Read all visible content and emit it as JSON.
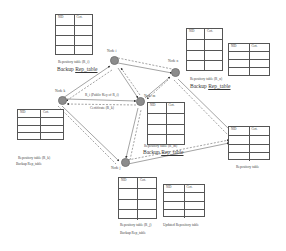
{
  "diagram": {
    "nodes": [
      {
        "id": "node-i",
        "label": "Node i"
      },
      {
        "id": "node-k",
        "label": "Node k"
      },
      {
        "id": "node-n",
        "label": "Node n"
      },
      {
        "id": "node-m",
        "label": "Node m"
      },
      {
        "id": "node-j",
        "label": "Node j"
      },
      {
        "id": "node-dest",
        "label": ""
      }
    ],
    "table_headers": {
      "nid": "NID",
      "cert": "Cert."
    },
    "labels": {
      "tl_repo": "Repository table (R_i)",
      "tl_backup_a": "Backup ",
      "tl_backup_b": "Rep_table",
      "tr_repo": "Repository table (R_n)",
      "tr_backup_a": "Backup ",
      "tr_backup_b": "Rep_table",
      "ml_repo": "Repository table (R_k)",
      "ml_backup": "Backup Rep_table",
      "center_repo": "Repository table (R_m)",
      "center_backup_a": "Backup ",
      "center_backup_b": "Rep_table",
      "right_repo": "Repository table",
      "bottom_repo": "Repository table (R_j)",
      "bottom_backup": "Backup Rep_table",
      "updated_repo": "Updated Repository table",
      "edge_top": "R_i (Public Key of R_i)",
      "edge_bottom": "Certificate (R_k)"
    }
  }
}
